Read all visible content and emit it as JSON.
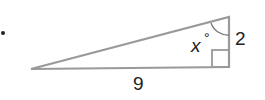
{
  "diagram": {
    "type": "right-triangle",
    "labels": {
      "angle": "x",
      "degree_symbol": "°",
      "vertical_side": "2",
      "horizontal_side": "9"
    },
    "colors": {
      "stroke": "#9a9a9a",
      "text": "#222222"
    }
  }
}
